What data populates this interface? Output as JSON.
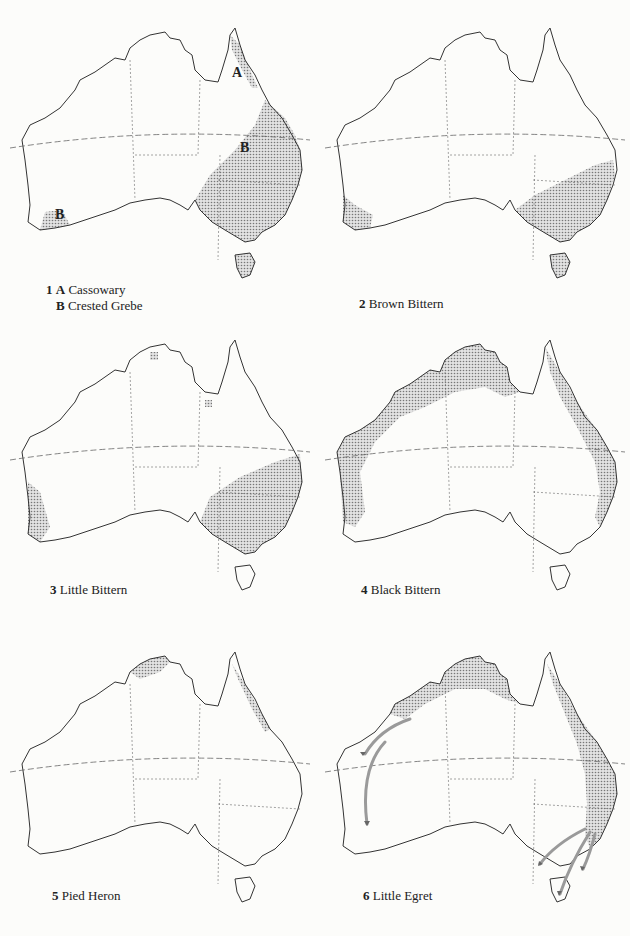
{
  "page": {
    "panels": [
      {
        "number": "1",
        "caption_lines": [
          {
            "key": "A",
            "label": "Cassowary"
          },
          {
            "key": "B",
            "label": "Crested Grebe"
          }
        ],
        "map_labels": [
          "A",
          "B",
          "B"
        ],
        "shaded_regions": [
          "north-east Queensland coast (A)",
          "eastern Australia and Tasmania (B)",
          "south-west Western Australia (B)"
        ]
      },
      {
        "number": "2",
        "caption": "Brown Bittern",
        "shaded_regions": [
          "south-eastern Australia",
          "south-west Western Australia",
          "Tasmania"
        ]
      },
      {
        "number": "3",
        "caption": "Little Bittern",
        "shaded_regions": [
          "south-eastern Australia",
          "south-west Western Australia",
          "Top End spots"
        ]
      },
      {
        "number": "4",
        "caption": "Black Bittern",
        "shaded_regions": [
          "northern coast",
          "eastern coast",
          "western coast"
        ]
      },
      {
        "number": "5",
        "caption": "Pied Heron",
        "shaded_regions": [
          "Top End coast",
          "north Queensland coast"
        ]
      },
      {
        "number": "6",
        "caption": "Little Egret",
        "shaded_regions": [
          "northern coast",
          "eastern coast"
        ],
        "annotations": [
          "migration arrows from north-west to south-west",
          "migration arrows from east to south-east and Tasmania"
        ]
      }
    ]
  },
  "colors": {
    "background": "#fcfcfa",
    "outline": "#333333",
    "shading": "#bdbdbd",
    "border_dashed": "#666666",
    "arrow": "#9a9a9a"
  }
}
